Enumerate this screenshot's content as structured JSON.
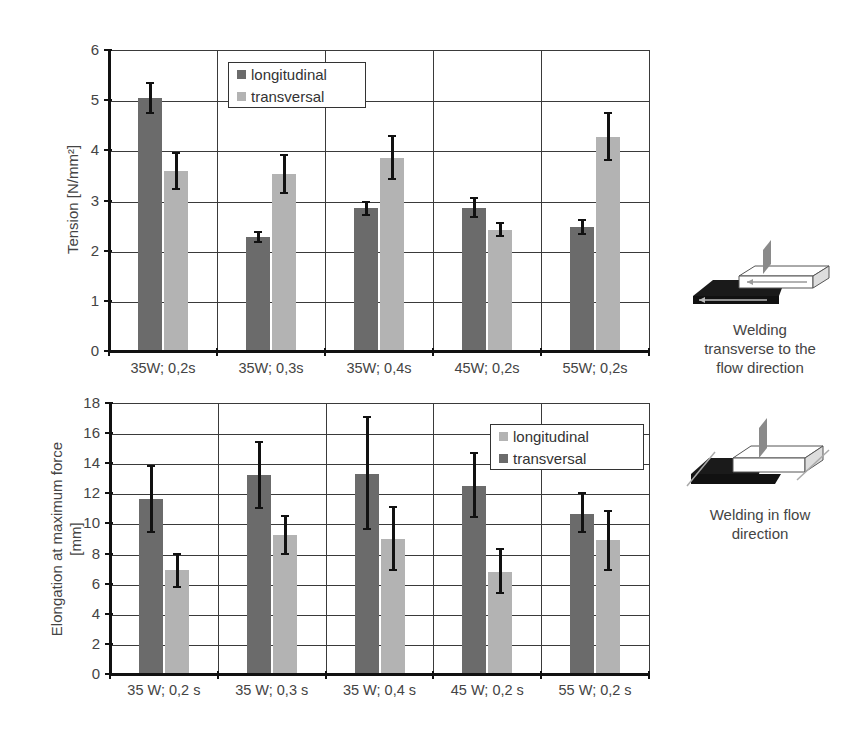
{
  "colors": {
    "longitudinal": "#6b6b6b",
    "transversal": "#b3b3b3",
    "axis": "#111111",
    "grid": "#3a3a3a"
  },
  "chart_data": [
    {
      "type": "bar",
      "title": "",
      "xlabel": "",
      "ylabel": "Tension   [N/mm²]",
      "ylim": [
        0,
        6
      ],
      "yticks": [
        0,
        1,
        2,
        3,
        4,
        5,
        6
      ],
      "grid": true,
      "legend_position": "top-left-inside",
      "legend": [
        {
          "label": "longitudinal",
          "swatch": "#6b6b6b"
        },
        {
          "label": "transversal",
          "swatch": "#b3b3b3"
        }
      ],
      "categories": [
        "35W; 0,2s",
        "35W; 0,3s",
        "35W; 0,4s",
        "45W; 0,2s",
        "55W; 0,2s"
      ],
      "series": [
        {
          "name": "longitudinal",
          "color": "#6b6b6b",
          "values": [
            5.05,
            2.27,
            2.85,
            2.85,
            2.48
          ],
          "err_low": [
            4.75,
            2.17,
            2.72,
            2.67,
            2.33
          ],
          "err_high": [
            5.35,
            2.37,
            2.98,
            3.05,
            2.62
          ]
        },
        {
          "name": "transversal",
          "color": "#b3b3b3",
          "values": [
            3.58,
            3.52,
            3.85,
            2.42,
            4.27
          ],
          "err_low": [
            3.22,
            3.15,
            3.42,
            2.3,
            3.8
          ],
          "err_high": [
            3.95,
            3.9,
            4.28,
            2.56,
            4.75
          ]
        }
      ]
    },
    {
      "type": "bar",
      "title": "",
      "xlabel": "",
      "ylabel": "Elongation at maximum force [mm]",
      "ylabel_lines": [
        "Elongation at maximum force",
        "[mm]"
      ],
      "ylim": [
        0,
        18
      ],
      "yticks": [
        0,
        2,
        4,
        6,
        8,
        10,
        12,
        14,
        16,
        18
      ],
      "grid": true,
      "legend_position": "top-right-inside",
      "legend": [
        {
          "label": "longitudinal",
          "swatch": "#b3b3b3"
        },
        {
          "label": "transversal",
          "swatch": "#6b6b6b"
        }
      ],
      "categories": [
        "35 W; 0,2 s",
        "35 W; 0,3 s",
        "35 W; 0,4 s",
        "45 W; 0,2 s",
        "55 W; 0,2 s"
      ],
      "series": [
        {
          "name": "dark bars",
          "color": "#6b6b6b",
          "values": [
            11.6,
            13.2,
            13.3,
            12.5,
            10.6
          ],
          "err_low": [
            9.4,
            11.0,
            9.6,
            10.4,
            9.4
          ],
          "err_high": [
            13.8,
            15.4,
            17.1,
            14.7,
            12.0
          ]
        },
        {
          "name": "light bars",
          "color": "#b3b3b3",
          "values": [
            6.9,
            9.2,
            9.0,
            6.8,
            8.9
          ],
          "err_low": [
            5.8,
            8.0,
            6.9,
            5.4,
            6.9
          ],
          "err_high": [
            8.0,
            10.5,
            11.1,
            8.3,
            10.8
          ]
        }
      ]
    }
  ],
  "diagrams": {
    "transverse": {
      "caption_lines": [
        "Welding",
        "transverse to the",
        "flow direction"
      ]
    },
    "in_flow": {
      "caption_lines": [
        "Welding in flow",
        "direction"
      ]
    }
  }
}
